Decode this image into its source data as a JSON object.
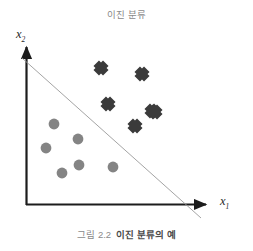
{
  "chart_data": {
    "type": "scatter",
    "title": "이진 분류",
    "caption_number": "그림 2.2",
    "caption_text": "이진 분류의 예",
    "xlabel": "x",
    "xlabel_sub": "1",
    "ylabel": "x",
    "ylabel_sub": "2",
    "grid": false,
    "legend": "none",
    "axis_origin": [
      26,
      205
    ],
    "axis_x_end": [
      213,
      205
    ],
    "axis_y_end": [
      26,
      45
    ],
    "xlim": [
      0,
      200
    ],
    "ylim": [
      0,
      170
    ],
    "colors": {
      "class_circle": "#848484",
      "class_cross": "#3b3b3b",
      "axis": "#1c1c1c",
      "boundary": "#9a9a9a",
      "title": "#8a8a8a",
      "caption": "#6f6f6f",
      "background": "#ffffff"
    },
    "decision_boundary": {
      "name": "decision-boundary",
      "x1": 22,
      "y1": 58,
      "x2": 201,
      "y2": 218,
      "stroke": "#9a9a9a",
      "stroke_width": 0.9
    },
    "series": [
      {
        "name": "class-0",
        "marker": "circle",
        "color": "#848484",
        "radius": 5.4,
        "points": [
          {
            "x": 54,
            "y": 124
          },
          {
            "x": 78,
            "y": 139
          },
          {
            "x": 46,
            "y": 148
          },
          {
            "x": 79,
            "y": 165
          },
          {
            "x": 62,
            "y": 173
          },
          {
            "x": 113,
            "y": 167
          }
        ]
      },
      {
        "name": "class-1",
        "marker": "cross",
        "color": "#3b3b3b",
        "size": 13,
        "points": [
          {
            "x": 101,
            "y": 68
          },
          {
            "x": 142,
            "y": 74
          },
          {
            "x": 108,
            "y": 104
          },
          {
            "x": 152,
            "y": 111
          },
          {
            "x": 135,
            "y": 126
          },
          {
            "x": 155,
            "y": 112
          }
        ]
      }
    ]
  }
}
